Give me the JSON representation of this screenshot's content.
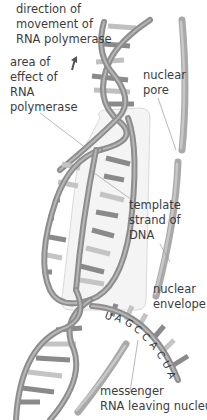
{
  "diagram": {
    "labels": {
      "direction": "direction of\nmovement of\nRNA polymerase",
      "area_of_effect": "area of\neffect of\nRNA\npolymerase",
      "nuclear_pore": "nuclear\npore",
      "template_strand": "template\nstrand of\nDNA",
      "nuclear_envelope": "nuclear\nenvelope",
      "messenger_rna": "messenger\nRNA leaving nucleus"
    },
    "rna_sequence": [
      "U",
      "A",
      "G",
      "C",
      "C",
      "A",
      "C",
      "U",
      "A"
    ],
    "arrow": "up-arrow",
    "colors": {
      "background": "#ffffff",
      "strand": "#8f8f8f",
      "strand_light": "#b9b9b9",
      "base_dark": "#7a7a7a",
      "base_light": "#c4c4c4",
      "envelope": "#a6a6a6",
      "leader_line": "#9a9a9a",
      "text": "#3c3c3c",
      "box": "#d6d6d6"
    }
  }
}
